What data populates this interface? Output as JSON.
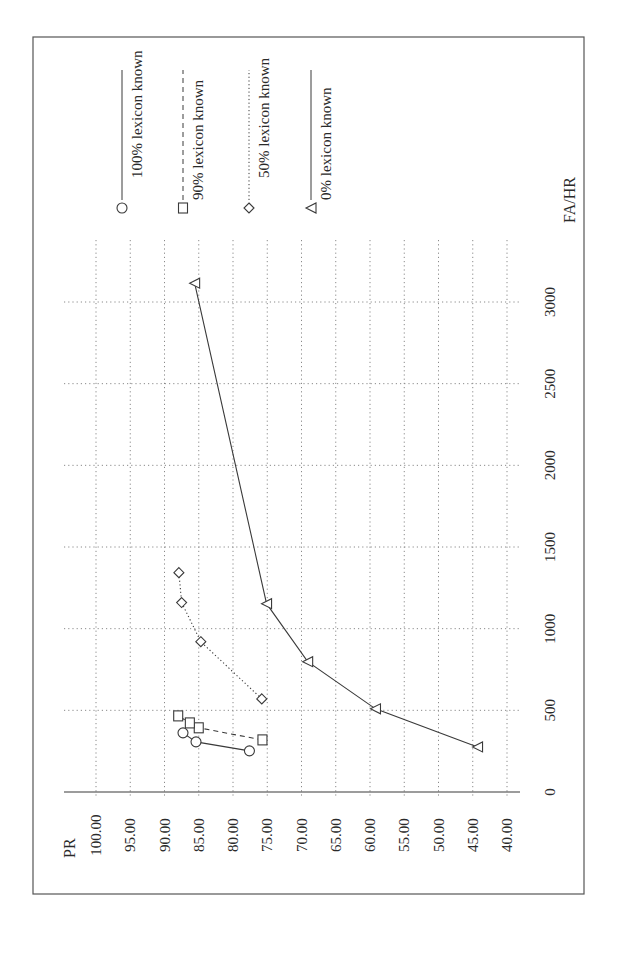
{
  "chart_data": {
    "type": "line",
    "orientation": "rotated-90-ccw",
    "title": "",
    "xlabel": "FA/HR",
    "ylabel": "PR",
    "xlim": [
      0,
      3000
    ],
    "ylim": [
      40,
      100
    ],
    "x_ticks": [
      "0",
      "500",
      "1000",
      "1500",
      "2000",
      "2500",
      "3000"
    ],
    "x_tick_values": [
      0,
      500,
      1000,
      1500,
      2000,
      2500,
      3000
    ],
    "y_ticks": [
      "100.00",
      "95.00",
      "90.00",
      "85.00",
      "80.00",
      "75.00",
      "70.00",
      "65.00",
      "60.00",
      "55.00",
      "50.00",
      "45.00",
      "40.00"
    ],
    "y_tick_values": [
      100,
      95,
      90,
      85,
      80,
      75,
      70,
      65,
      60,
      55,
      50,
      45,
      40
    ],
    "grid": true,
    "legend_position": "right",
    "series": [
      {
        "name": "100% lexicon known",
        "marker": "circle",
        "line_style": "solid",
        "x": [
          252,
          307,
          362
        ],
        "y": [
          77.6,
          85.4,
          87.3
        ]
      },
      {
        "name": "90% lexicon known",
        "marker": "square",
        "line_style": "dashed",
        "x": [
          319,
          393,
          423,
          466
        ],
        "y": [
          75.7,
          85.0,
          86.3,
          88.0
        ]
      },
      {
        "name": "50% lexicon known",
        "marker": "diamond",
        "line_style": "dotted",
        "x": [
          570,
          920,
          1160,
          1343
        ],
        "y": [
          75.8,
          84.7,
          87.5,
          87.9
        ]
      },
      {
        "name": "0% lexicon known",
        "marker": "triangle",
        "line_style": "solid",
        "x": [
          276,
          509,
          798,
          1153,
          3115
        ],
        "y": [
          44.3,
          59.2,
          69.1,
          75.1,
          85.6
        ]
      }
    ]
  },
  "colors": {
    "ink": "#3a3a3a",
    "grid": "#8a8a8a",
    "frame": "#555555"
  }
}
